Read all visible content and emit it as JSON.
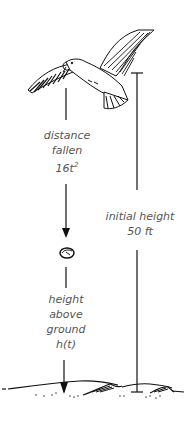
{
  "diagram": {
    "falling_object": "stone dropped by seagull",
    "labels": {
      "distance_fallen": {
        "line1": "distance",
        "line2": "fallen",
        "expr_base": "16t",
        "expr_exp": "2"
      },
      "initial_height": {
        "line1": "initial height",
        "line2": "50 ft"
      },
      "height_above_ground": {
        "line1": "height",
        "line2": "above",
        "line3": "ground",
        "line4": "h(t)"
      }
    },
    "icons": {
      "bird": "seagull-icon",
      "stone": "stone-icon",
      "ground": "ground-icon"
    },
    "colors": {
      "ink": "#111111",
      "text": "#555555"
    }
  }
}
